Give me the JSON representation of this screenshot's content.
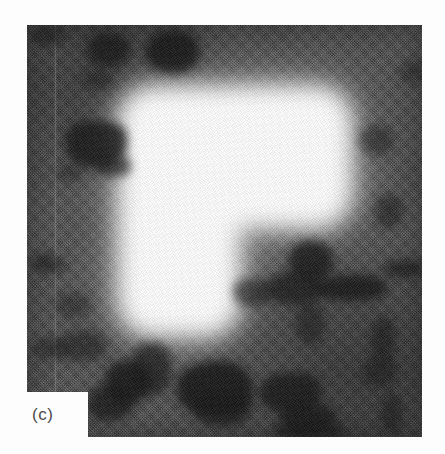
{
  "figure": {
    "panel_label": "(c)",
    "modality": "grayscale-micrograph",
    "object_shape": "gamma-shaped-bright-region",
    "background_tone": "#414141",
    "object_tone": "#ffffff",
    "blob_tone": "#141414",
    "page_background": "#fdfdfd"
  },
  "image_region": {
    "left": 27,
    "top": 25,
    "width": 395,
    "height": 412
  },
  "label_notch": {
    "left": 27,
    "top": 392,
    "width": 61,
    "height": 45
  },
  "object_geometry": {
    "stem": {
      "left": 92,
      "top": 62,
      "width": 120,
      "height": 248
    },
    "arm": {
      "left": 92,
      "top": 62,
      "width": 232,
      "height": 140
    },
    "blur_radius_px": 11
  },
  "seams": [
    {
      "left": 27,
      "opacity": 0.16
    }
  ],
  "blobs": [
    {
      "left": 60,
      "top": 8,
      "width": 44,
      "height": 34,
      "opacity": 0.8
    },
    {
      "left": 118,
      "top": 6,
      "width": 54,
      "height": 42,
      "opacity": 0.88
    },
    {
      "left": 3,
      "top": 1,
      "width": 34,
      "height": 20,
      "opacity": 0.55
    },
    {
      "left": 56,
      "top": 46,
      "width": 30,
      "height": 18,
      "opacity": 0.5
    },
    {
      "left": 38,
      "top": 96,
      "width": 62,
      "height": 46,
      "opacity": 0.85
    },
    {
      "left": 68,
      "top": 130,
      "width": 36,
      "height": 22,
      "opacity": 0.7
    },
    {
      "left": 30,
      "top": 140,
      "width": 26,
      "height": 16,
      "opacity": 0.45
    },
    {
      "left": 5,
      "top": 228,
      "width": 24,
      "height": 20,
      "opacity": 0.6
    },
    {
      "left": 24,
      "top": 234,
      "width": 16,
      "height": 14,
      "opacity": 0.45
    },
    {
      "left": 28,
      "top": 268,
      "width": 36,
      "height": 24,
      "opacity": 0.42
    },
    {
      "left": 30,
      "top": 306,
      "width": 50,
      "height": 30,
      "opacity": 0.55
    },
    {
      "left": 5,
      "top": 312,
      "width": 34,
      "height": 22,
      "opacity": 0.48
    },
    {
      "left": 78,
      "top": 336,
      "width": 46,
      "height": 44,
      "opacity": 0.86
    },
    {
      "left": 104,
      "top": 318,
      "width": 40,
      "height": 52,
      "opacity": 0.7
    },
    {
      "left": 60,
      "top": 360,
      "width": 46,
      "height": 36,
      "opacity": 0.78
    },
    {
      "left": 150,
      "top": 336,
      "width": 76,
      "height": 54,
      "opacity": 0.9
    },
    {
      "left": 166,
      "top": 368,
      "width": 58,
      "height": 34,
      "opacity": 0.72
    },
    {
      "left": 232,
      "top": 348,
      "width": 62,
      "height": 40,
      "opacity": 0.84
    },
    {
      "left": 252,
      "top": 378,
      "width": 58,
      "height": 28,
      "opacity": 0.8
    },
    {
      "left": 246,
      "top": 396,
      "width": 72,
      "height": 20,
      "opacity": 0.7
    },
    {
      "left": 336,
      "top": 332,
      "width": 34,
      "height": 30,
      "opacity": 0.58
    },
    {
      "left": 262,
      "top": 216,
      "width": 44,
      "height": 40,
      "opacity": 0.82
    },
    {
      "left": 240,
      "top": 246,
      "width": 56,
      "height": 34,
      "opacity": 0.74
    },
    {
      "left": 286,
      "top": 250,
      "width": 74,
      "height": 26,
      "opacity": 0.86
    },
    {
      "left": 206,
      "top": 254,
      "width": 40,
      "height": 28,
      "opacity": 0.62
    },
    {
      "left": 268,
      "top": 276,
      "width": 30,
      "height": 44,
      "opacity": 0.55
    },
    {
      "left": 344,
      "top": 292,
      "width": 24,
      "height": 44,
      "opacity": 0.62
    },
    {
      "left": 332,
      "top": 100,
      "width": 34,
      "height": 30,
      "opacity": 0.5
    },
    {
      "left": 348,
      "top": 170,
      "width": 28,
      "height": 34,
      "opacity": 0.55
    },
    {
      "left": 356,
      "top": 236,
      "width": 40,
      "height": 16,
      "opacity": 0.72
    },
    {
      "left": 354,
      "top": 368,
      "width": 22,
      "height": 40,
      "opacity": 0.58
    },
    {
      "left": 372,
      "top": 36,
      "width": 28,
      "height": 22,
      "opacity": 0.4
    }
  ]
}
